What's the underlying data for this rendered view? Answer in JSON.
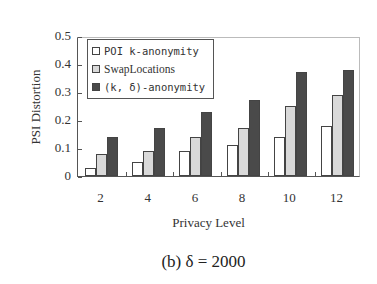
{
  "chart_data": {
    "type": "bar",
    "title": "",
    "caption": "(b) δ = 2000",
    "xlabel": "Privacy Level",
    "ylabel": "PSI Distortion",
    "ylim": [
      0,
      0.5
    ],
    "yticks": [
      "0",
      "0.1",
      "0.2",
      "0.3",
      "0.4",
      "0.5"
    ],
    "categories": [
      "2",
      "4",
      "6",
      "8",
      "10",
      "12"
    ],
    "series": [
      {
        "name": "POI k-anonymity",
        "color": "#ffffff",
        "values": [
          0.03,
          0.05,
          0.09,
          0.11,
          0.14,
          0.18
        ]
      },
      {
        "name": "SwapLocations",
        "color": "#d9d9d9",
        "values": [
          0.08,
          0.09,
          0.14,
          0.17,
          0.25,
          0.29
        ]
      },
      {
        "name": "(k, δ)-anonymity",
        "color": "#4a4a4a",
        "values": [
          0.14,
          0.17,
          0.23,
          0.27,
          0.37,
          0.38
        ]
      }
    ],
    "legend_position": "upper-left",
    "grid": false
  }
}
